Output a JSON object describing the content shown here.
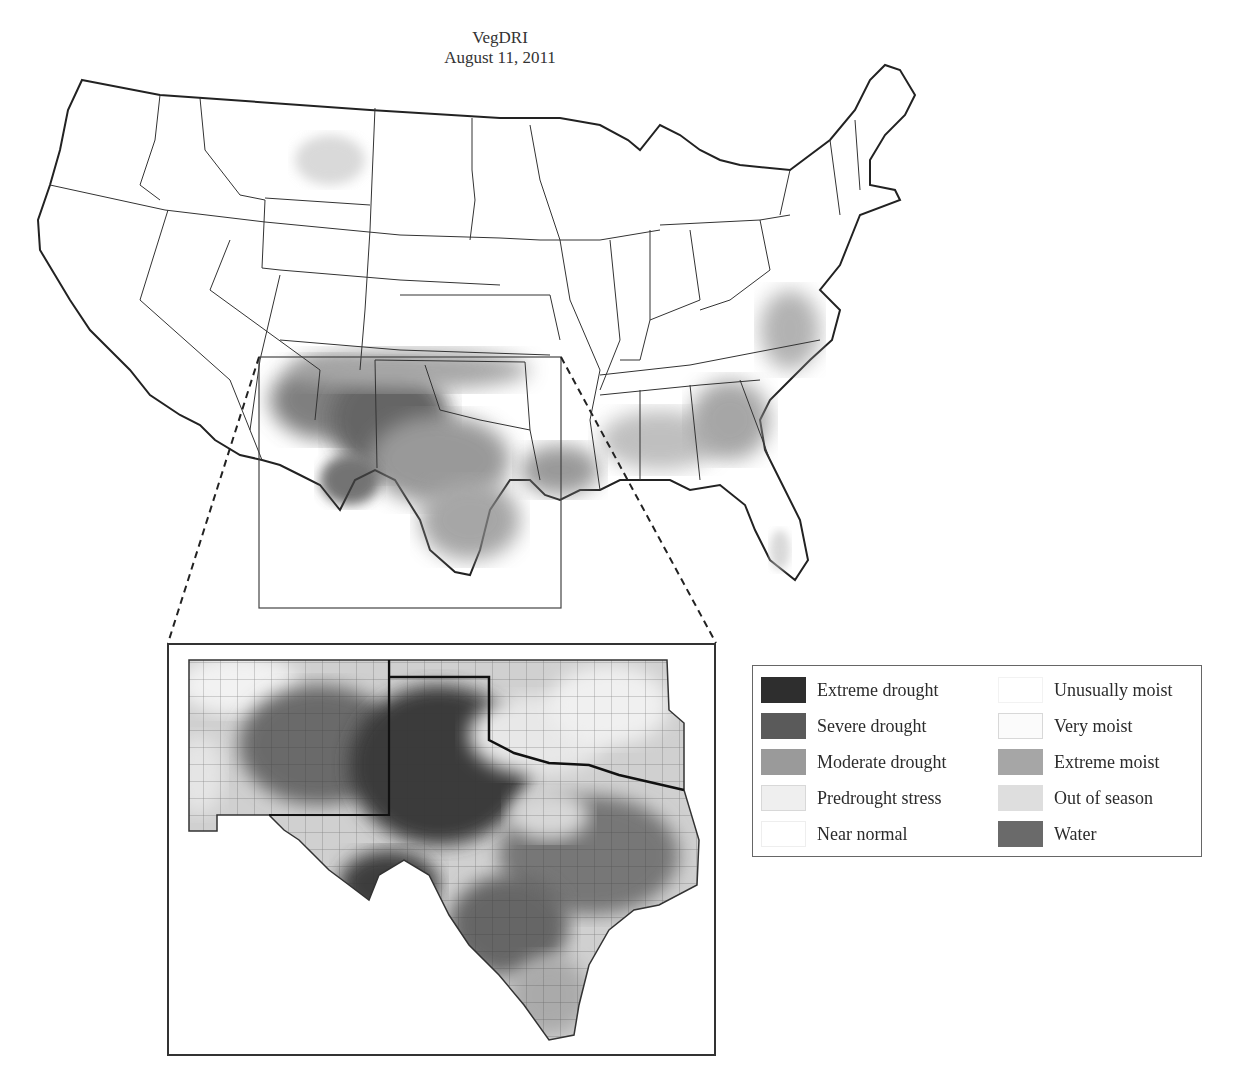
{
  "figure": {
    "title": "VegDRI",
    "date": "August 11, 2011"
  },
  "main_map": {
    "region": "Conterminous United States",
    "highlight_region": "Southern Plains (New Mexico, Oklahoma, Texas)",
    "inset_box": {
      "x": 259,
      "y": 357,
      "width": 302,
      "height": 251
    }
  },
  "inset_map": {
    "region": "New Mexico, Oklahoma and Texas (county boundaries)"
  },
  "legend": {
    "left_column": [
      {
        "label": "Extreme drought",
        "color": "#2e2e2e"
      },
      {
        "label": "Severe drought",
        "color": "#5a5a5a"
      },
      {
        "label": "Moderate drought",
        "color": "#9a9a9a"
      },
      {
        "label": "Predrought stress",
        "color": "#efefef"
      },
      {
        "label": "Near normal",
        "color": "#ffffff"
      }
    ],
    "right_column": [
      {
        "label": "Unusually moist",
        "color": "#ffffff"
      },
      {
        "label": "Very moist",
        "color": "#fbfbfb"
      },
      {
        "label": "Extreme moist",
        "color": "#a6a6a6"
      },
      {
        "label": "Out of season",
        "color": "#dedede"
      },
      {
        "label": "Water",
        "color": "#6a6a6a"
      }
    ]
  }
}
